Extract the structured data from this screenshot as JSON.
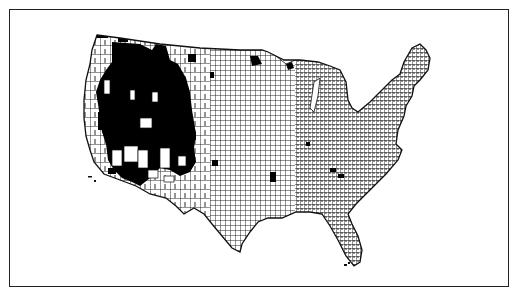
{
  "figure": {
    "type": "choropleth map",
    "frame_color": "#222222",
    "background": "#ffffff"
  },
  "legend": null,
  "colors": {
    "highlighted_fill": "#000000",
    "default_fill": "#ffffff",
    "boundary": "#111111"
  },
  "regions": {
    "highlighted_description": "Large contiguous block of black counties across the Intermountain West (Nevada, Utah, Idaho, eastern Oregon, western Wyoming/Colorado, northern Arizona/New Mexico), plus scattered counties in Washington, northern Montana, northern Minnesota, Arkansas, Oklahoma and Tennessee",
    "highlighted_states_core": [
      "Nevada",
      "Utah",
      "Idaho",
      "Oregon",
      "Wyoming",
      "Colorado",
      "Arizona",
      "New Mexico"
    ],
    "scattered_highlights": [
      "Washington",
      "Montana",
      "Minnesota",
      "Oklahoma",
      "Arkansas",
      "Tennessee",
      "Texas"
    ]
  }
}
